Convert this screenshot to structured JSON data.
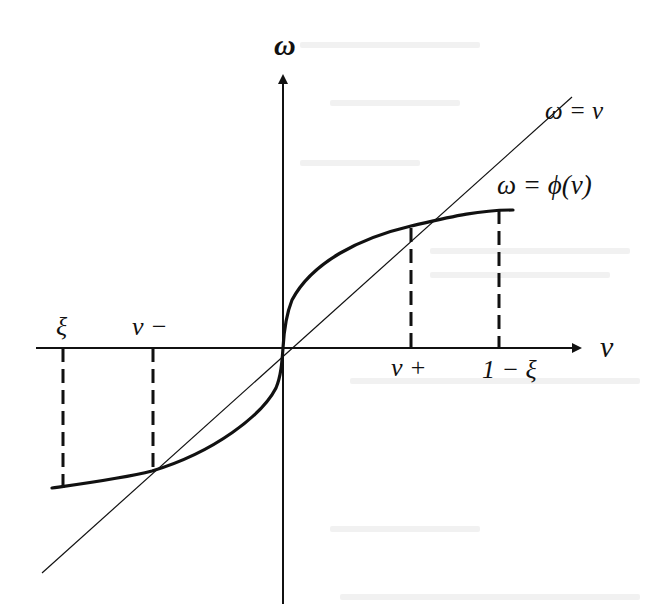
{
  "figure": {
    "type": "function-plot",
    "colors": {
      "background": "#ffffff",
      "ink": "#111111",
      "ghost_text": "#eeeeee"
    },
    "axes": {
      "x_label": "ν",
      "y_label": "ω"
    },
    "curves": {
      "identity_label": "ω = ν",
      "phi_label": "ω = ϕ(ν)"
    },
    "x_ticks": [
      {
        "label": "ξ",
        "position": "left-end",
        "above_axis": true
      },
      {
        "label": "ν −",
        "position": "left-fixed-point",
        "above_axis": true
      },
      {
        "label": "ν +",
        "position": "right-fixed-point",
        "above_axis": false
      },
      {
        "label": "1 − ξ",
        "position": "right-end",
        "above_axis": false
      }
    ]
  }
}
